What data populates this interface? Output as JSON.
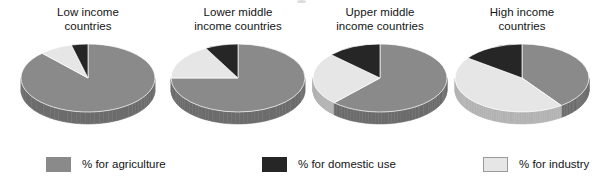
{
  "chart_data": {
    "type": "pie",
    "title": "",
    "legend_position": "bottom",
    "categories": [
      "% for agriculture",
      "% for domestic use",
      "% for industry"
    ],
    "colors": {
      "agriculture": "#8a8a8a",
      "domestic": "#262626",
      "industry": "#e6e6e6"
    },
    "charts": [
      {
        "title_line1": "Low income",
        "title_line2": "countries",
        "slices": [
          {
            "label": "% for agriculture",
            "value": 88
          },
          {
            "label": "% for domestic use",
            "value": 4
          },
          {
            "label": "% for industry",
            "value": 8
          }
        ]
      },
      {
        "title_line1": "Lower middle",
        "title_line2": "income countries",
        "slices": [
          {
            "label": "% for agriculture",
            "value": 75
          },
          {
            "label": "% for domestic use",
            "value": 8
          },
          {
            "label": "% for industry",
            "value": 17
          }
        ]
      },
      {
        "title_line1": "Upper middle",
        "title_line2": "income countries",
        "slices": [
          {
            "label": "% for agriculture",
            "value": 62
          },
          {
            "label": "% for domestic use",
            "value": 13
          },
          {
            "label": "% for industry",
            "value": 25
          }
        ]
      },
      {
        "title_line1": "High income",
        "title_line2": "countries",
        "slices": [
          {
            "label": "% for agriculture",
            "value": 40
          },
          {
            "label": "% for domestic use",
            "value": 15
          },
          {
            "label": "% for industry",
            "value": 45
          }
        ]
      }
    ]
  },
  "charts": [
    {
      "title_line1": "Low income",
      "title_line2": "countries"
    },
    {
      "title_line1": "Lower middle",
      "title_line2": "income countries"
    },
    {
      "title_line1": "Upper middle",
      "title_line2": "income countries"
    },
    {
      "title_line1": "High income",
      "title_line2": "countries"
    }
  ],
  "legend": {
    "items": [
      {
        "label": "% for agriculture",
        "color": "#8a8a8a"
      },
      {
        "label": "% for domestic use",
        "color": "#262626"
      },
      {
        "label": "% for industry",
        "color": "#e6e6e6"
      }
    ]
  }
}
